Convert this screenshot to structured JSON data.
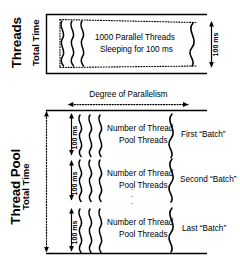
{
  "figure": {
    "type": "technical-diagram"
  },
  "top_panel": {
    "section_title": "Threads",
    "y_axis_label": "Total Time",
    "body_line_1": "1000 Parallel Threads",
    "body_line_2": "Sleeping for 100 ms",
    "duration_label": "100 ms",
    "thread_squiggle_count": 3,
    "trailing_squiggle_count": 1
  },
  "axis": {
    "parallelism_label": "Degree of Parallelism"
  },
  "bottom_panel": {
    "section_title": "Thread Pool",
    "y_axis_label": "Total Time",
    "ellipsis": "·",
    "batches": [
      {
        "body_line_1": "Number of Thread",
        "body_line_2": "Pool Threads",
        "duration_label": "100 ms",
        "batch_label": "First “Batch”"
      },
      {
        "body_line_1": "Number of Thread",
        "body_line_2": "Pool Threads",
        "duration_label": "100 ms",
        "batch_label": "Second “Batch”"
      },
      {
        "body_line_1": "Number of Thread",
        "body_line_2": "Pool Threads",
        "duration_label": "100 ms",
        "batch_label": "Last “Batch”"
      }
    ]
  },
  "colors": {
    "ink": "#000000",
    "background": "#ffffff"
  }
}
